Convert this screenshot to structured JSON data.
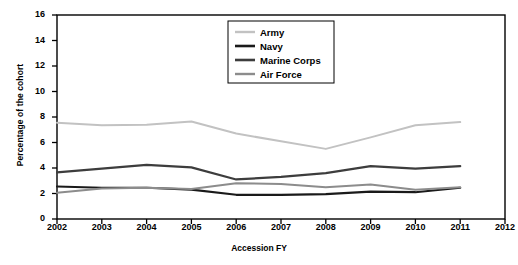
{
  "chart_data": {
    "type": "line",
    "title": "",
    "xlabel": "Accession FY",
    "ylabel": "Percentage of the cohort",
    "x": [
      2002,
      2003,
      2004,
      2005,
      2006,
      2007,
      2008,
      2009,
      2010,
      2011
    ],
    "xtick_labels": [
      "2002",
      "2003",
      "2004",
      "2005",
      "2006",
      "2007",
      "2008",
      "2009",
      "2010",
      "2011",
      "2012"
    ],
    "ytick_labels": [
      "0",
      "2",
      "4",
      "6",
      "8",
      "10",
      "12",
      "14",
      "16"
    ],
    "xlim": [
      2002,
      2012
    ],
    "ylim": [
      0,
      16
    ],
    "grid": false,
    "legend_position": "top-center",
    "series": [
      {
        "name": "Army",
        "color": "#c2c2c2",
        "width": 2.0,
        "values": [
          7.55,
          7.35,
          7.4,
          7.65,
          6.7,
          6.1,
          5.5,
          6.4,
          7.35,
          7.6
        ]
      },
      {
        "name": "Navy",
        "color": "#1a1a1a",
        "width": 2.2,
        "values": [
          2.55,
          2.45,
          2.45,
          2.3,
          1.9,
          1.9,
          1.95,
          2.15,
          2.1,
          2.45
        ]
      },
      {
        "name": "Marine Corps",
        "color": "#3d3d3d",
        "width": 2.2,
        "values": [
          3.65,
          3.95,
          4.25,
          4.05,
          3.1,
          3.3,
          3.6,
          4.15,
          3.95,
          4.15
        ]
      },
      {
        "name": "Air Force",
        "color": "#8c8c8c",
        "width": 2.0,
        "values": [
          2.05,
          2.4,
          2.45,
          2.35,
          2.8,
          2.75,
          2.5,
          2.7,
          2.3,
          2.5
        ]
      }
    ]
  },
  "legend": {
    "entries": [
      "Army",
      "Navy",
      "Marine Corps",
      "Air Force"
    ]
  },
  "axis_color": "#000000",
  "background": "#ffffff"
}
